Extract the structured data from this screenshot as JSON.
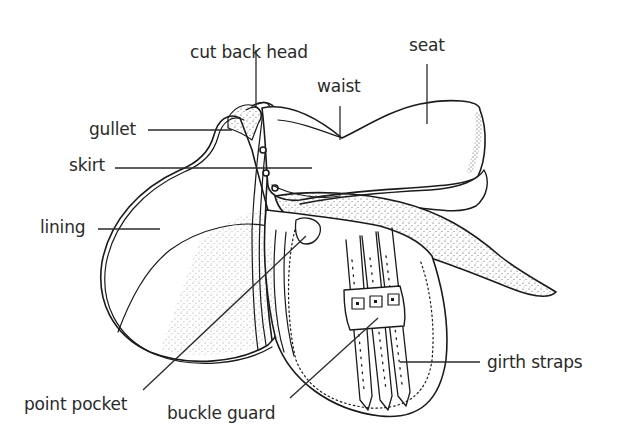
{
  "diagram": {
    "labels": [
      {
        "id": "cut-back-head",
        "text": "cut back head",
        "x": 190,
        "y": 44
      },
      {
        "id": "seat",
        "text": "seat",
        "x": 409,
        "y": 37
      },
      {
        "id": "waist",
        "text": "waist",
        "x": 317,
        "y": 78
      },
      {
        "id": "gullet",
        "text": "gullet",
        "x": 89,
        "y": 121
      },
      {
        "id": "skirt",
        "text": "skirt",
        "x": 69,
        "y": 157
      },
      {
        "id": "lining",
        "text": "lining",
        "x": 40,
        "y": 219
      },
      {
        "id": "girth-straps",
        "text": "girth straps",
        "x": 487,
        "y": 356
      },
      {
        "id": "point-pocket",
        "text": "point pocket",
        "x": 24,
        "y": 396
      },
      {
        "id": "buckle-guard",
        "text": "buckle guard",
        "x": 167,
        "y": 405
      }
    ],
    "colors": {
      "ink": "#1a1a1a",
      "label": "#2a2a2a",
      "background": "#ffffff"
    }
  }
}
